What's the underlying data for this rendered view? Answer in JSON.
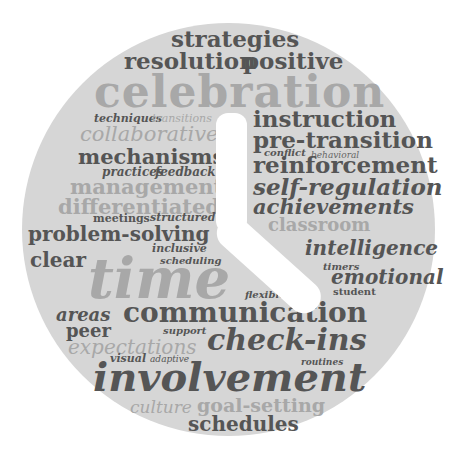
{
  "image": {
    "description": "Word cloud shaped as a clock face",
    "background": "#ffffff",
    "disc_color": "#d6d6d6"
  },
  "colors": {
    "dark": "#555555",
    "mid": "#666666",
    "light": "#a8a8a8",
    "hands": "#ffffff"
  },
  "words": {
    "strategies": "strategies",
    "resolution": "resolution",
    "positive": "positive",
    "celebration": "celebration",
    "techniques": "techniques",
    "transitions": "transitions",
    "collaborative": "collaborative",
    "instruction": "instruction",
    "pre_transition": "pre-transition",
    "conflict": "conflict",
    "behavioral": "behavioral",
    "mechanisms": "mechanisms",
    "practices": "practices",
    "feedback": "feedback",
    "reinforcement": "reinforcement",
    "management": "management",
    "self_regulation": "self-regulation",
    "differentiated": "differentiated",
    "achievements": "achievements",
    "meetings": "meetings",
    "structured": "structured",
    "classroom": "classroom",
    "problem_solving": "problem-solving",
    "inclusive": "inclusive",
    "intelligence": "intelligence",
    "clear": "clear",
    "scheduling": "scheduling",
    "timers": "timers",
    "time": "time",
    "emotional": "emotional",
    "student": "student",
    "flexible": "flexible",
    "areas": "areas",
    "communication": "communication",
    "peer": "peer",
    "support": "support",
    "check_ins": "check-ins",
    "expectations": "expectations",
    "visual": "visual",
    "adaptive": "adaptive",
    "routines": "routines",
    "involvement": "involvement",
    "culture": "culture",
    "goal_setting": "goal-setting",
    "schedules": "schedules"
  }
}
